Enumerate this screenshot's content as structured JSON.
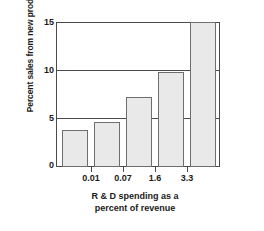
{
  "chart_data": {
    "type": "bar",
    "title": "",
    "xlabel_line1": "R & D spending as a",
    "xlabel_line2": "percent of revenue",
    "ylabel": "Percent sales from new products",
    "categories": [
      "",
      "0.01",
      "0.07",
      "1.6",
      "3.3"
    ],
    "xtick_labels": [
      "0.01",
      "0.07",
      "1.6",
      "3.3"
    ],
    "values": [
      3.8,
      4.7,
      7.2,
      9.8,
      15.0
    ],
    "ytick_labels": [
      "0",
      "5",
      "10",
      "15"
    ],
    "ytick_values": [
      0,
      5,
      10,
      15
    ],
    "ylim": [
      0,
      15
    ],
    "grid": "horizontal",
    "legend": "none",
    "bar_fill_color": "#e9e9e9",
    "bar_edge_color": "#6e6e6e",
    "axis_color": "#4a4a4a",
    "background_color": "#ffffff"
  }
}
